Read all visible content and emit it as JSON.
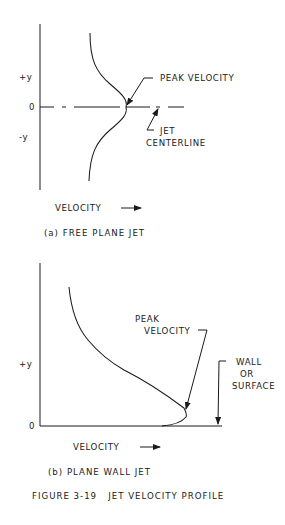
{
  "figure": {
    "caption": "FIGURE 3-19   JET VELOCITY PROFILE"
  },
  "panel_a": {
    "subtitle": "(a) FREE PLANE JET",
    "y_labels": {
      "plus": "+y",
      "zero": "0",
      "minus": "-y"
    },
    "x_label": "VELOCITY",
    "annotations": {
      "peak": "PEAK VELOCITY",
      "centerline_1": "JET",
      "centerline_2": "CENTERLINE"
    }
  },
  "panel_b": {
    "subtitle": "(b) PLANE WALL JET",
    "y_labels": {
      "plus": "+y",
      "zero": "0"
    },
    "x_label": "VELOCITY",
    "annotations": {
      "peak_1": "PEAK",
      "peak_2": "VELOCITY",
      "wall_1": "WALL",
      "wall_2": "OR",
      "wall_3": "SURFACE"
    }
  },
  "colors": {
    "ink": "#1a1a1a",
    "background": "#ffffff"
  }
}
